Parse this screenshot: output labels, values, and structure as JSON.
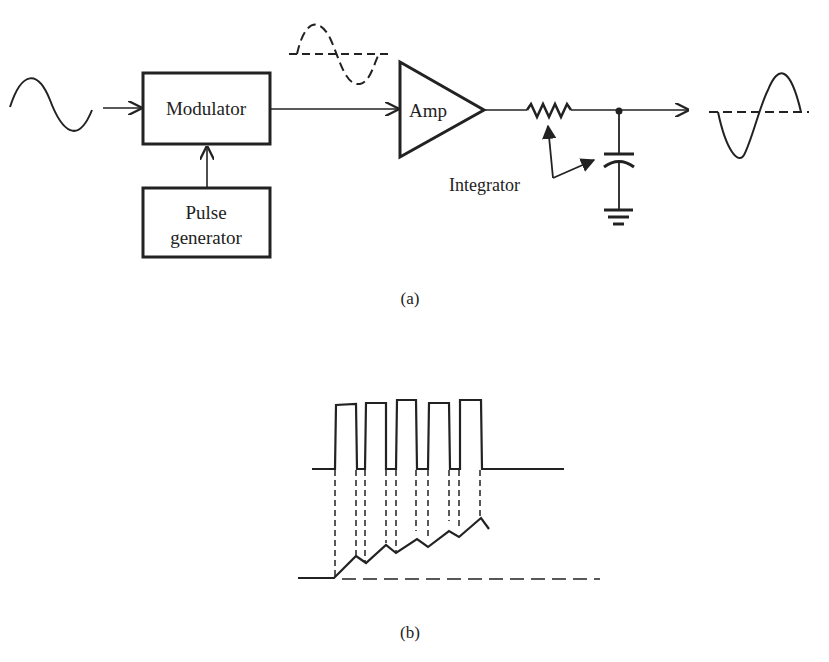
{
  "figure_a": {
    "caption": "(a)",
    "blocks": {
      "modulator": "Modulator",
      "pulse_generator_line1": "Pulse",
      "pulse_generator_line2": "generator",
      "amplifier": "Amp"
    },
    "annotations": {
      "integrator": "Integrator"
    },
    "signals": {
      "input": "sine-wave",
      "amplified": "dashed-sine-wave",
      "output": "sine-wave-with-dashed-axis"
    }
  },
  "figure_b": {
    "caption": "(b)",
    "pulse_count": 5,
    "description": "Pulse train with integrated staircase ramp output"
  },
  "colors": {
    "ink": "#222222",
    "background": "#ffffff"
  }
}
